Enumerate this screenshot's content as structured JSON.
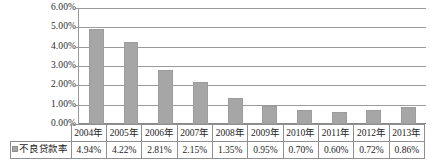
{
  "chart_data": {
    "type": "bar",
    "title": "",
    "subtitle": "",
    "xlabel": "",
    "ylabel": "",
    "ylim": [
      0,
      6
    ],
    "y_tick_step": 1,
    "y_ticks": [
      "0.00%",
      "1.00%",
      "2.00%",
      "3.00%",
      "4.00%",
      "5.00%",
      "6.00%"
    ],
    "grid": "horizontal",
    "legend_position": "data-table-row-header",
    "categories": [
      "2004年",
      "2005年",
      "2006年",
      "2007年",
      "2008年",
      "2009年",
      "2010年",
      "2011年",
      "2012年",
      "2013年"
    ],
    "series": [
      {
        "name": "不良贷款率",
        "marker": "■",
        "color": "#a6a6a6",
        "values": [
          4.94,
          4.22,
          2.81,
          2.15,
          1.35,
          0.95,
          0.7,
          0.6,
          0.72,
          0.86
        ],
        "value_labels": [
          "4.94%",
          "4.22%",
          "2.81%",
          "2.15%",
          "1.35%",
          "0.95%",
          "0.70%",
          "0.60%",
          "0.72%",
          "0.86%"
        ]
      }
    ],
    "data_table": {
      "row_header_label": "不良贷款率",
      "column_headers": [
        "2004年",
        "2005年",
        "2006年",
        "2007年",
        "2008年",
        "2009年",
        "2010年",
        "2011年",
        "2012年",
        "2013年"
      ],
      "rows": [
        {
          "label": "不良贷款率",
          "cells": [
            "4.94%",
            "4.22%",
            "2.81%",
            "2.15%",
            "1.35%",
            "0.95%",
            "0.70%",
            "0.60%",
            "0.72%",
            "0.86%"
          ]
        }
      ]
    },
    "colors": {
      "bar_fill": "#a6a6a6",
      "bar_stroke": "#9c9c9c",
      "gridline": "#9b9b9b",
      "axis": "#8a8a8a",
      "table_border": "#8f8f8f",
      "text": "#1e1e1e",
      "background": "#ffffff"
    }
  }
}
